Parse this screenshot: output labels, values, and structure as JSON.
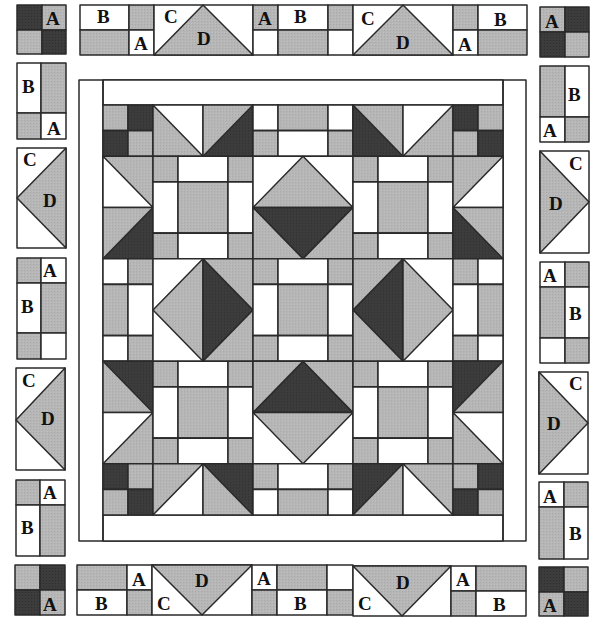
{
  "diagram": {
    "type": "quilt-assembly",
    "colors": {
      "light": "#ffffff",
      "medium": "#b4b4b4",
      "dark": "#3a3a3a",
      "outline": "#2a2a2a"
    },
    "labels": {
      "a": "A",
      "b": "B",
      "c": "C",
      "d": "D"
    },
    "pieces": [
      {
        "name": "A",
        "shape": "small square"
      },
      {
        "name": "B",
        "shape": "rectangle"
      },
      {
        "name": "C",
        "shape": "small triangle"
      },
      {
        "name": "D",
        "shape": "large triangle"
      }
    ],
    "border_units": {
      "top": [
        "corner-four-patch",
        "B-A unit",
        "C-D flying geese",
        "A-B unit",
        "C-D flying geese",
        "A-B unit",
        "corner-four-patch"
      ],
      "bottom": [
        "corner-four-patch",
        "A-B unit",
        "C-D flying geese",
        "A-B unit",
        "C-D flying geese",
        "A-B unit",
        "corner-four-patch"
      ],
      "left": [
        "B-A unit",
        "C-D flying geese",
        "A-B unit",
        "C-D flying geese",
        "A-B unit"
      ],
      "right": [
        "B-A unit",
        "C-D flying geese",
        "A-B unit",
        "C-D flying geese",
        "A-B unit"
      ]
    },
    "center": {
      "grid": "3 x 3 blocks with sashing frame",
      "blocks": [
        "nine-patch",
        "square-in-square",
        "nine-patch",
        "square-in-square",
        "nine-patch",
        "square-in-square",
        "nine-patch",
        "square-in-square",
        "nine-patch"
      ]
    }
  }
}
